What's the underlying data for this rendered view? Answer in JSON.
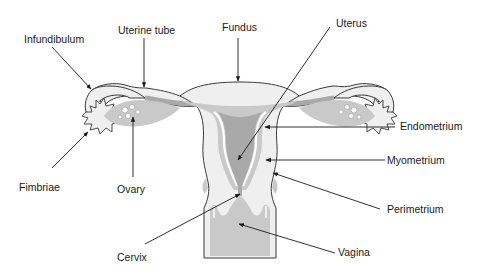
{
  "diagram": {
    "colors": {
      "outline": "#3a3a3a",
      "light_fill": "#efefef",
      "mid_fill": "#c9c9c9",
      "dark_fill": "#a9a9a9",
      "white_line": "#ffffff",
      "label": "#1a1a1a"
    },
    "labels": {
      "infundibulum": "Infundibulum",
      "uterine_tube": "Uterine tube",
      "fundus": "Fundus",
      "uterus": "Uterus",
      "endometrium": "Endometrium",
      "myometrium": "Myometrium",
      "perimetrium": "Perimetrium",
      "fimbriae": "Fimbriae",
      "ovary": "Ovary",
      "cervix": "Cervix",
      "vagina": "Vagina"
    }
  }
}
